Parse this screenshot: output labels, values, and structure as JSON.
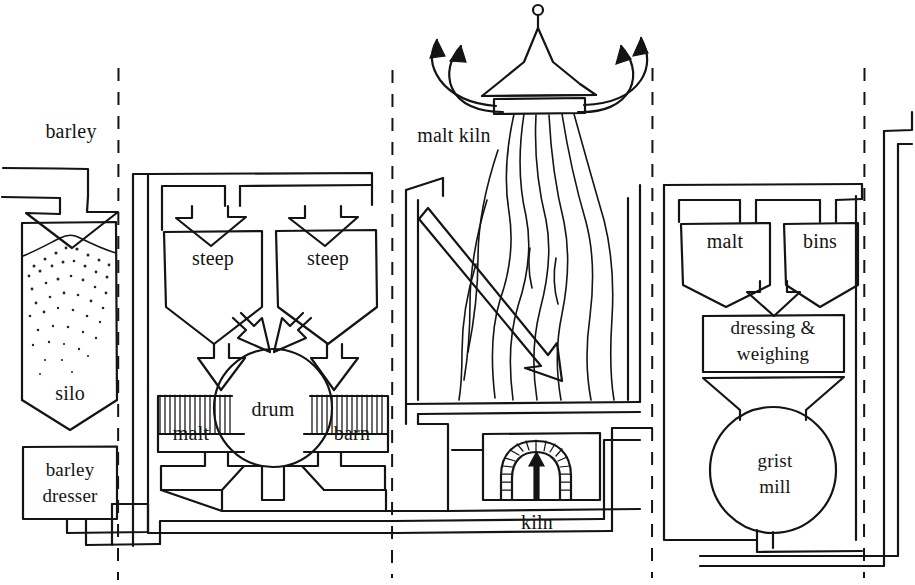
{
  "diagram": {
    "style": "hand-drawn ink line illustration",
    "ink_color": "#141414",
    "background_color": "#ffffff",
    "width": 915,
    "height": 585
  },
  "sections": [
    {
      "name": "barley intake",
      "divider_right_x": 118
    },
    {
      "name": "steeping and germination",
      "divider_right_x": 392
    },
    {
      "name": "kilning",
      "divider_right_x": 652
    },
    {
      "name": "malt dressing and milling",
      "divider_right_x": 864
    }
  ],
  "dividers": [
    {
      "name": "dashed-divider-1",
      "x": 118
    },
    {
      "name": "dashed-divider-2",
      "x": 392
    },
    {
      "name": "dashed-divider-3",
      "x": 652
    },
    {
      "name": "dashed-divider-4",
      "x": 864
    }
  ],
  "labels": {
    "barley": "barley",
    "silo": "silo",
    "barley_dresser_line1": "barley",
    "barley_dresser_line2": "dresser",
    "steep_left": "steep",
    "steep_right": "steep",
    "malt_left": "malt",
    "drum": "drum",
    "barn": "barn",
    "malt_kiln": "malt kiln",
    "kiln": "kiln",
    "malt_bin": "malt",
    "bins": "bins",
    "dressing_line1": "dressing &",
    "dressing_line2": "weighing",
    "grist_line1": "grist",
    "grist_line2": "mill"
  },
  "equipment": [
    {
      "id": "silo",
      "label": "silo",
      "shape": "tall bin with pointed base, filled with stippled grain"
    },
    {
      "id": "barley-dresser",
      "label": "barley dresser",
      "shape": "rectangle"
    },
    {
      "id": "steep-left",
      "label": "steep",
      "shape": "hopper"
    },
    {
      "id": "steep-right",
      "label": "steep",
      "shape": "hopper"
    },
    {
      "id": "drum",
      "label": "drum",
      "shape": "circle"
    },
    {
      "id": "malt-barn-left",
      "label": "malt",
      "shape": "hatched-top box"
    },
    {
      "id": "malt-barn-right",
      "label": "barn",
      "shape": "hatched-top box"
    },
    {
      "id": "malt-kiln",
      "label": "malt kiln",
      "shape": "pagoda cowl with finial, smoke arrows, wavy heat lines"
    },
    {
      "id": "kiln-furnace",
      "label": "kiln",
      "shape": "brick arch firebox with up arrow"
    },
    {
      "id": "malt-bin",
      "label": "malt",
      "shape": "hopper"
    },
    {
      "id": "bins",
      "label": "bins",
      "shape": "hopper"
    },
    {
      "id": "dressing-weighing",
      "label": "dressing & weighing",
      "shape": "rectangle"
    },
    {
      "id": "grist-mill",
      "label": "grist mill",
      "shape": "circle with hopper top"
    }
  ]
}
